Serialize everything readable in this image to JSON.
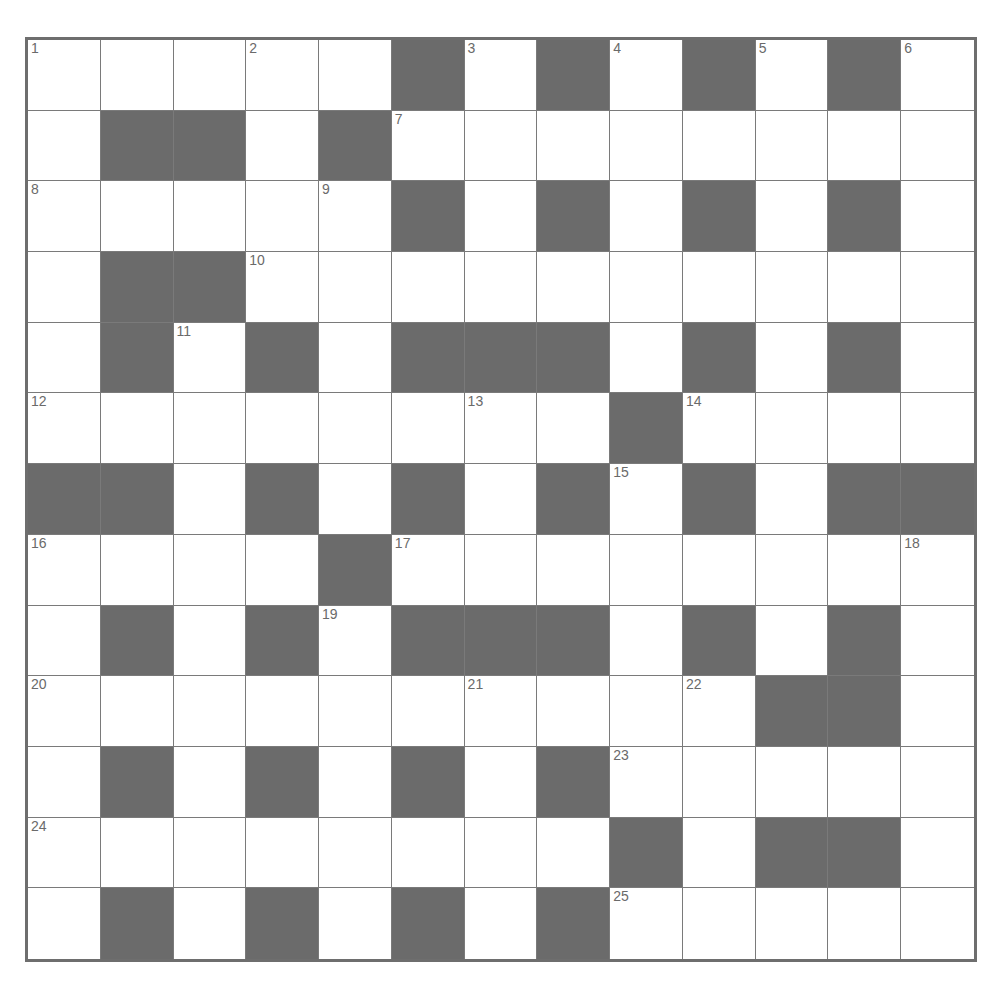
{
  "puzzle": {
    "rows": 13,
    "cols": 13,
    "colors": {
      "block": "#6b6b6b",
      "cell": "#ffffff",
      "line": "#7a7a7a",
      "number": "#6a6a6a"
    },
    "layout": [
      "1..2.#3#4#5#6",
      ".##.#7.......",
      "8...9#.#.#.#.",
      ".##10.........",
      ".#11#.###.#.#.",
      "12.....13.#14...",
      "##.#.#.#15#.##",
      "16...#17......18",
      ".#.#19###.#.#.",
      "20.....21..22##.",
      ".#.#.#.#23....",
      "24.......#.##.",
      ".#.#.#.#25...."
    ],
    "grid": [
      [
        "1",
        "",
        "",
        "2",
        "",
        "#",
        "3",
        "#",
        "4",
        "#",
        "5",
        "#",
        "6"
      ],
      [
        "",
        "#",
        "#",
        "",
        "#",
        "7",
        "",
        "",
        "",
        "",
        "",
        "",
        ""
      ],
      [
        "8",
        "",
        "",
        "",
        "9",
        "#",
        "",
        "#",
        "",
        "#",
        "",
        "#",
        ""
      ],
      [
        "",
        "#",
        "#",
        "10",
        "",
        "",
        "",
        "",
        "",
        "",
        "",
        "",
        ""
      ],
      [
        "",
        "#",
        "11",
        "#",
        "",
        "#",
        "#",
        "#",
        "",
        "#",
        "",
        "#",
        ""
      ],
      [
        "12",
        "",
        "",
        "",
        "",
        "",
        "13",
        "",
        "#",
        "14",
        "",
        "",
        ""
      ],
      [
        "#",
        "#",
        "",
        "#",
        "",
        "#",
        "",
        "#",
        "15",
        "#",
        "",
        "#",
        "#"
      ],
      [
        "16",
        "",
        "",
        "",
        "#",
        "17",
        "",
        "",
        "",
        "",
        "",
        "",
        "18"
      ],
      [
        "",
        "#",
        "",
        "#",
        "19",
        "#",
        "#",
        "#",
        "",
        "#",
        "",
        "#",
        ""
      ],
      [
        "20",
        "",
        "",
        "",
        "",
        "",
        "21",
        "",
        "",
        "22",
        "#",
        "#",
        ""
      ],
      [
        "",
        "#",
        "",
        "#",
        "",
        "#",
        "",
        "#",
        "23",
        "",
        "",
        "",
        ""
      ],
      [
        "24",
        "",
        "",
        "",
        "",
        "",
        "",
        "",
        "#",
        "",
        "#",
        "#",
        ""
      ],
      [
        "",
        "#",
        "",
        "#",
        "",
        "#",
        "",
        "#",
        "25",
        "",
        "",
        "",
        ""
      ]
    ]
  }
}
